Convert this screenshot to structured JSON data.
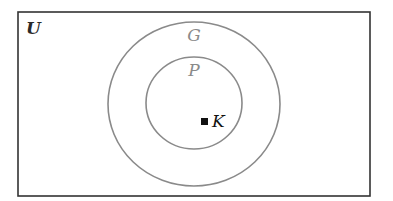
{
  "diagram": {
    "type": "venn",
    "universe": {
      "label": "U",
      "color": "#333333"
    },
    "sets": [
      {
        "id": "G",
        "label": "G",
        "color": "#8a8a8a",
        "contains": [
          "P"
        ]
      },
      {
        "id": "P",
        "label": "P",
        "color": "#8a8a8a",
        "contains": [
          "K"
        ]
      }
    ],
    "elements": [
      {
        "id": "K",
        "label": "K",
        "marker": "filled-square",
        "in_set": "P"
      }
    ]
  }
}
